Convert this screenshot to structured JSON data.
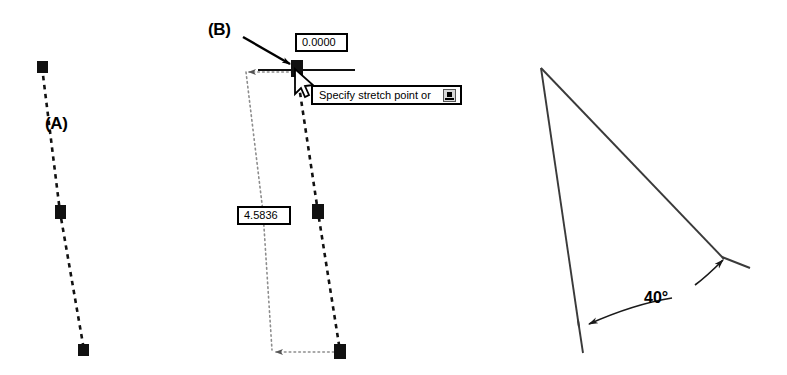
{
  "figure": {
    "background_color": "#ffffff",
    "line_color": "#000000",
    "grip_color": "#000000",
    "width": 787,
    "height": 375
  },
  "labels": {
    "a": "(A)",
    "b": "(B)"
  },
  "dynamic_input": {
    "angle_field": {
      "icon": "text-input-box",
      "value": "0.0000"
    },
    "length_field": {
      "icon": "text-input-box",
      "value": "4.5836"
    },
    "prompt": {
      "text": "Specify stretch point or",
      "expand_icon": "expand-options-icon"
    }
  },
  "angle_dimension": {
    "value": "40°"
  },
  "cursor": {
    "icon": "arrow-cursor"
  },
  "panel_a": {
    "name": "dashed-polyline-original",
    "grips": [
      {
        "x": 42,
        "y": 67
      },
      {
        "x": 60,
        "y": 212
      },
      {
        "x": 84,
        "y": 350
      }
    ],
    "polyline": "42,67 60,212 84,350"
  },
  "panel_b": {
    "name": "dashed-polyline-stretched",
    "grips": [
      {
        "x": 296,
        "y": 66
      },
      {
        "x": 318,
        "y": 212
      },
      {
        "x": 340,
        "y": 351
      }
    ],
    "polyline": "296,66 318,212 340,351",
    "tracking_line": "156,70 355,70",
    "reference_frame": "246,71 263,350 340,351"
  },
  "panel_c": {
    "name": "angle-triangle",
    "vertices": [
      {
        "x": 541,
        "y": 68
      },
      {
        "x": 582,
        "y": 352
      },
      {
        "x": 748,
        "y": 260
      }
    ],
    "segments": [
      "541,68 578,320",
      "541,68 723,258",
      "578,320 582,352",
      "723,258 748,268"
    ],
    "arc": "from 586,324 to 722,258"
  }
}
